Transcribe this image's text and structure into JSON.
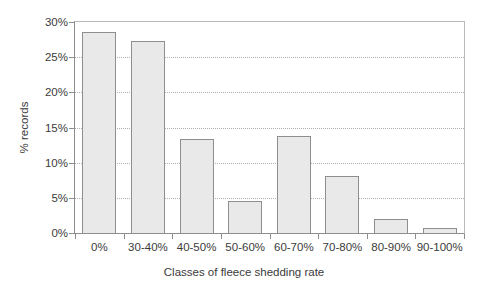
{
  "chart_data": {
    "type": "bar",
    "title": "",
    "xlabel": "Classes of fleece shedding rate",
    "ylabel": "% records",
    "categories": [
      "0%",
      "30-40%",
      "40-50%",
      "50-60%",
      "60-70%",
      "70-80%",
      "80-90%",
      "90-100%"
    ],
    "values": [
      28.7,
      27.5,
      13.5,
      4.7,
      13.9,
      8.2,
      2.1,
      0.8
    ],
    "ylim": [
      0,
      30
    ],
    "ytick_values": [
      0,
      5,
      10,
      15,
      20,
      25,
      30
    ],
    "ytick_labels": [
      "0%",
      "5%",
      "10%",
      "15%",
      "20%",
      "25%",
      "30%"
    ],
    "grid": true,
    "grid_axis": "y",
    "legend": false,
    "legend_position": "none",
    "bar_fill_color": "#e9e9e9",
    "bar_edge_color": "#8e8e8e",
    "axis_color": "#8d8d8d",
    "gridline_color": "#b0b0b0",
    "text_color": "#3b3b3b",
    "background_color": "#ffffff"
  }
}
